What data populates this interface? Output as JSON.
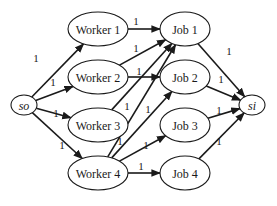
{
  "diagram": {
    "title": "",
    "type": "bipartite flow network",
    "colors": {
      "stroke": "#1a1a1a",
      "fill": "#ffffff",
      "background": "#ffffff"
    },
    "nodes": [
      {
        "id": "so",
        "label": "so",
        "italic": true,
        "cx": 24,
        "cy": 105,
        "rx": 13,
        "ry": 10
      },
      {
        "id": "w1",
        "label": "Worker 1",
        "italic": false,
        "cx": 98,
        "cy": 29,
        "rx": 30,
        "ry": 17
      },
      {
        "id": "w2",
        "label": "Worker 2",
        "italic": false,
        "cx": 98,
        "cy": 77,
        "rx": 30,
        "ry": 17
      },
      {
        "id": "w3",
        "label": "Worker 3",
        "italic": false,
        "cx": 98,
        "cy": 125,
        "rx": 30,
        "ry": 17
      },
      {
        "id": "w4",
        "label": "Worker 4",
        "italic": false,
        "cx": 98,
        "cy": 173,
        "rx": 30,
        "ry": 17
      },
      {
        "id": "j1",
        "label": "Job 1",
        "italic": false,
        "cx": 185,
        "cy": 29,
        "rx": 25,
        "ry": 17
      },
      {
        "id": "j2",
        "label": "Job 2",
        "italic": false,
        "cx": 185,
        "cy": 77,
        "rx": 25,
        "ry": 17
      },
      {
        "id": "j3",
        "label": "Job 3",
        "italic": false,
        "cx": 185,
        "cy": 125,
        "rx": 25,
        "ry": 17
      },
      {
        "id": "j4",
        "label": "Job 4",
        "italic": false,
        "cx": 185,
        "cy": 173,
        "rx": 25,
        "ry": 17
      },
      {
        "id": "si",
        "label": "si",
        "italic": true,
        "cx": 252,
        "cy": 105,
        "rx": 13,
        "ry": 10
      }
    ],
    "edges": [
      {
        "from": "so",
        "to": "w1",
        "capacity": "1",
        "lx": 36,
        "ly": 58
      },
      {
        "from": "so",
        "to": "w2",
        "capacity": "1",
        "lx": 53,
        "ly": 82
      },
      {
        "from": "so",
        "to": "w3",
        "capacity": "1",
        "lx": 56,
        "ly": 113
      },
      {
        "from": "so",
        "to": "w4",
        "capacity": "1",
        "lx": 62,
        "ly": 145
      },
      {
        "from": "w1",
        "to": "j1",
        "capacity": "1",
        "lx": 136,
        "ly": 21
      },
      {
        "from": "w2",
        "to": "j1",
        "capacity": "1",
        "lx": 136,
        "ly": 48
      },
      {
        "from": "w2",
        "to": "j2",
        "capacity": "1",
        "lx": 139,
        "ly": 71
      },
      {
        "from": "w3",
        "to": "j1",
        "capacity": "1",
        "lx": 127,
        "ly": 106
      },
      {
        "from": "w4",
        "to": "j1",
        "capacity": "1",
        "lx": 120,
        "ly": 141
      },
      {
        "from": "w4",
        "to": "j2",
        "capacity": "1",
        "lx": 148,
        "ly": 109
      },
      {
        "from": "w4",
        "to": "j3",
        "capacity": "1",
        "lx": 146,
        "ly": 145
      },
      {
        "from": "w4",
        "to": "j4",
        "capacity": "1",
        "lx": 141,
        "ly": 166
      },
      {
        "from": "j1",
        "to": "si",
        "capacity": "1",
        "lx": 229,
        "ly": 51
      },
      {
        "from": "j2",
        "to": "si",
        "capacity": "1",
        "lx": 221,
        "ly": 79
      },
      {
        "from": "j3",
        "to": "si",
        "capacity": "1",
        "lx": 219,
        "ly": 110
      },
      {
        "from": "j4",
        "to": "si",
        "capacity": "1",
        "lx": 219,
        "ly": 141
      }
    ]
  }
}
